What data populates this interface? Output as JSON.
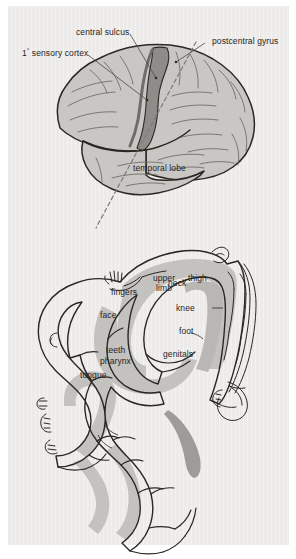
{
  "figure": {
    "background_color": "#ecebe9",
    "page_border_color": "#ffffff",
    "ink_color": "#26231f",
    "brain_fill_color": "#c9c7c4",
    "cortex_band_color": "#8e8c88",
    "section_band_color": "#c4c2bf"
  },
  "lateral_view": {
    "name": "lateral-brain-view",
    "labels": [
      {
        "id": "central-sulcus",
        "text": "central sulcus",
        "leader": true
      },
      {
        "id": "primary-sensory-cortex",
        "text_pre": "1",
        "text_sup": "°",
        "text_post": " sensory cortex",
        "text": "1° sensory cortex",
        "leader": true
      },
      {
        "id": "postcentral-gyrus",
        "text": "postcentral gyrus",
        "leader": true
      },
      {
        "id": "temporal-lobe",
        "text": "temporal lobe",
        "leader": false
      }
    ],
    "dashed_plane": {
      "id": "section-plane",
      "description": "dashed line indicating plane of the coronal section shown below"
    }
  },
  "coronal_section": {
    "name": "sensory-homunculus-section",
    "description": "coronal section through the postcentral gyrus showing somatotopic representation",
    "labels": [
      {
        "id": "upper-limb",
        "line1": "upper",
        "line2": "limb",
        "text": "upper limb",
        "leader": false
      },
      {
        "id": "fingers",
        "text": "fingers",
        "leader": false
      },
      {
        "id": "face",
        "text": "face",
        "leader": false
      },
      {
        "id": "teeth",
        "text": "teeth",
        "leader": true
      },
      {
        "id": "pharynx",
        "text": "pharynx",
        "leader": true
      },
      {
        "id": "tongue",
        "text": "tongue",
        "leader": false
      },
      {
        "id": "neck",
        "text": "neck",
        "leader": false
      },
      {
        "id": "thigh",
        "text": "thigh",
        "leader": false
      },
      {
        "id": "knee",
        "text": "knee",
        "leader": true
      },
      {
        "id": "foot",
        "text": "foot",
        "leader": false
      },
      {
        "id": "genitals",
        "text": "genitals",
        "leader": false
      }
    ],
    "body_figures": [
      {
        "id": "hand-figure",
        "description": "drawn hand and fingers at the crown of the section"
      },
      {
        "id": "head-figure",
        "description": "drawn face, teeth and tongue at the lateral-inferior edge"
      },
      {
        "id": "leg-figure",
        "description": "drawn leg and foot along the medial surface"
      }
    ]
  }
}
